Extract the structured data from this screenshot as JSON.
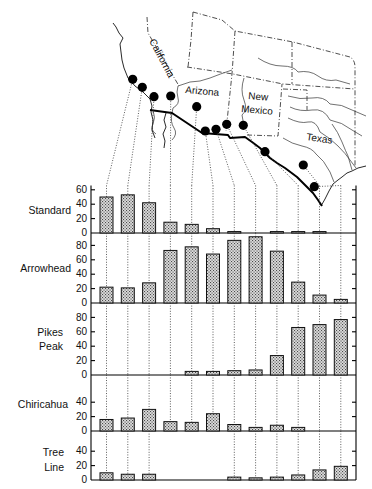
{
  "map": {
    "labels": {
      "california": "California",
      "arizona": "Arizona",
      "new_mexico_line1": "New",
      "new_mexico_line2": "Mexico",
      "texas": "Texas"
    },
    "site_count": 12
  },
  "chart_data": {
    "type": "bar",
    "title": "",
    "xlabel": "",
    "ylabel": "",
    "categories": [
      "site 1",
      "site 2",
      "site 3",
      "site 4",
      "site 5",
      "site 6",
      "site 7",
      "site 8",
      "site 9",
      "site 10",
      "site 11",
      "site 12"
    ],
    "category_order": "west to east",
    "grid": false,
    "series": [
      {
        "name": "Standard",
        "label_lines": [
          "Standard"
        ],
        "values": [
          50,
          53,
          42,
          15,
          12,
          6,
          2,
          0,
          2,
          2,
          2,
          0
        ],
        "ylim": [
          0,
          66
        ],
        "yticks": [
          0,
          20,
          40,
          60
        ]
      },
      {
        "name": "Arrowhead",
        "label_lines": [
          "Arrowhead"
        ],
        "values": [
          22,
          21,
          28,
          73,
          78,
          68,
          87,
          92,
          72,
          29,
          11,
          5
        ],
        "ylim": [
          0,
          97
        ],
        "yticks": [
          0,
          20,
          40,
          60,
          80
        ]
      },
      {
        "name": "Pikes Peak",
        "label_lines": [
          "Pikes",
          "Peak"
        ],
        "values": [
          0,
          0,
          0,
          0,
          5,
          5,
          6,
          7,
          27,
          66,
          70,
          77
        ],
        "ylim": [
          0,
          100
        ],
        "yticks": [
          0,
          20,
          40,
          60,
          80
        ]
      },
      {
        "name": "Chiricahua",
        "label_lines": [
          "Chiricahua"
        ],
        "values": [
          16,
          18,
          30,
          13,
          12,
          24,
          9,
          5,
          8,
          5,
          0,
          0
        ],
        "ylim": [
          0,
          78
        ],
        "yticks": [
          0,
          20,
          40
        ]
      },
      {
        "name": "Tree Line",
        "label_lines": [
          "Tree",
          "Line"
        ],
        "values": [
          10,
          8,
          8,
          null,
          null,
          null,
          4,
          3,
          4,
          7,
          14,
          19
        ],
        "ylim": [
          0,
          68
        ],
        "yticks": [
          0,
          20,
          40
        ]
      }
    ]
  }
}
